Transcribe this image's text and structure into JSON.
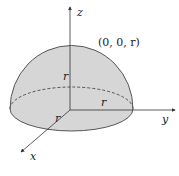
{
  "diagram": {
    "type": "hemisphere",
    "axes": {
      "z_label": "z",
      "y_label": "y",
      "x_label": "x"
    },
    "point_label": "(0, 0, r)",
    "radius_labels": {
      "vertical": "r",
      "horizontal": "r",
      "diagonal": "r"
    },
    "colors": {
      "fill": "#d6d6d6",
      "outline": "#555555",
      "axis": "#333333"
    }
  }
}
